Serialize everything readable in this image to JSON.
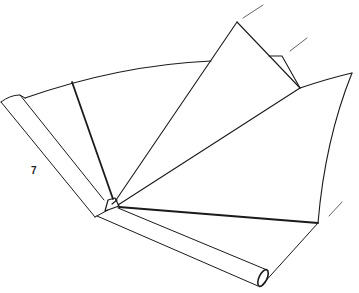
{
  "figure": {
    "step_label": "7",
    "stroke_color": "#1a1a1a",
    "background": "#ffffff"
  }
}
